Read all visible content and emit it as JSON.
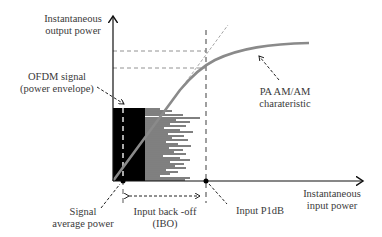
{
  "diagram": {
    "y_axis_label": [
      "Instantaneous",
      "output power"
    ],
    "x_axis_label": [
      "Instantaneous",
      "input power"
    ],
    "ofdm_label": [
      "OFDM signal",
      "(power envelope)"
    ],
    "pa_label": [
      "PA AM/AM",
      "charateristic"
    ],
    "avg_power_label": [
      "Signal",
      "average power"
    ],
    "ibo_label": [
      "Input back -off",
      "(IBO)"
    ],
    "p1db_label": "Input P1dB",
    "colors": {
      "axis": "#111111",
      "curve": "#8a8a8a",
      "dashed": "#777777",
      "envelope": "#000000",
      "text": "#3a3a3a"
    }
  }
}
